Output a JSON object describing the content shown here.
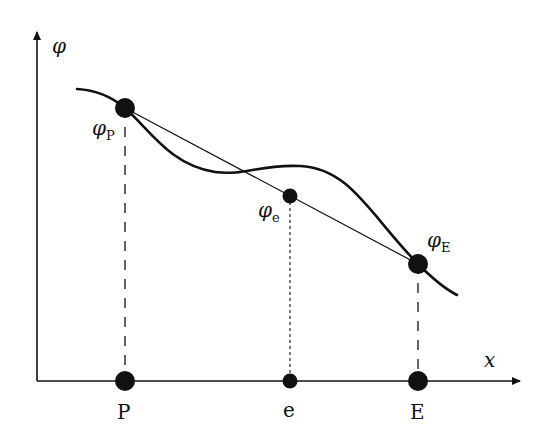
{
  "figure": {
    "y_axis_label": "φ",
    "x_axis_label": "x",
    "nodes": [
      {
        "id": "P",
        "axis_label": "P",
        "value_label_main": "φ",
        "value_label_sub": "P"
      },
      {
        "id": "e",
        "axis_label": "e",
        "value_label_main": "φ",
        "value_label_sub": "e"
      },
      {
        "id": "E",
        "axis_label": "E",
        "value_label_main": "φ",
        "value_label_sub": "E"
      }
    ],
    "colors": {
      "ink": "#111111",
      "background": "#ffffff"
    }
  }
}
